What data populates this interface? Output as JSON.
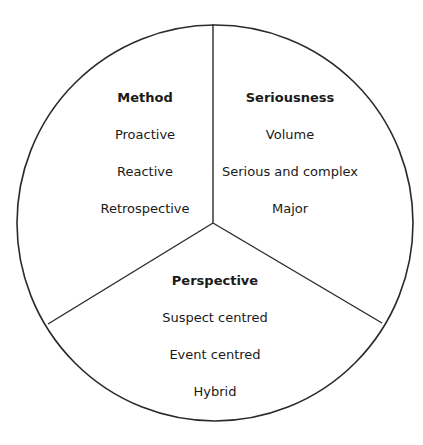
{
  "diagram": {
    "type": "three-segment-circle",
    "stroke_color": "#2a2a2a",
    "background": "#ffffff",
    "segments": [
      {
        "id": "method",
        "title": "Method",
        "items": [
          "Proactive",
          "Reactive",
          "Retrospective"
        ]
      },
      {
        "id": "seriousness",
        "title": "Seriousness",
        "items": [
          "Volume",
          "Serious and complex",
          "Major"
        ]
      },
      {
        "id": "perspective",
        "title": "Perspective",
        "items": [
          "Suspect centred",
          "Event centred",
          "Hybrid"
        ]
      }
    ]
  }
}
